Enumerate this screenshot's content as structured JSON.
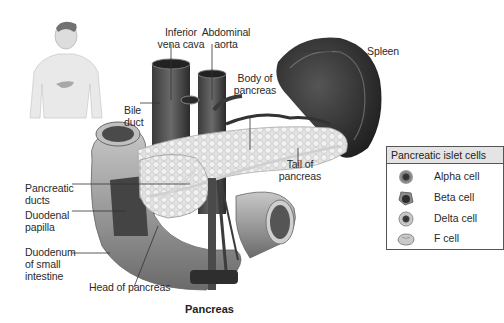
{
  "figure": {
    "caption": "Pancreas",
    "labels": {
      "inferior_vena_cava": "Inferior\nvena cava",
      "abdominal_aorta": "Abdominal\naorta",
      "body_of_pancreas": "Body of\npancreas",
      "spleen": "Spleen",
      "bile_duct": "Bile\nduct",
      "tail_of_pancreas": "Tail of\npancreas",
      "pancreatic_ducts": "Pancreatic\nducts",
      "duodenal_papilla": "Duodenal\npapilla",
      "duodenum": "Duodenum\nof small\nintestine",
      "head_of_pancreas": "Head of pancreas"
    },
    "inset": "human-torso-with-pancreas-location"
  },
  "legend": {
    "title": "Pancreatic islet cells",
    "items": [
      {
        "label": "Alpha cell",
        "icon": "alpha-cell-icon"
      },
      {
        "label": "Beta cell",
        "icon": "beta-cell-icon"
      },
      {
        "label": "Delta cell",
        "icon": "delta-cell-icon"
      },
      {
        "label": "F cell",
        "icon": "f-cell-icon"
      }
    ]
  }
}
